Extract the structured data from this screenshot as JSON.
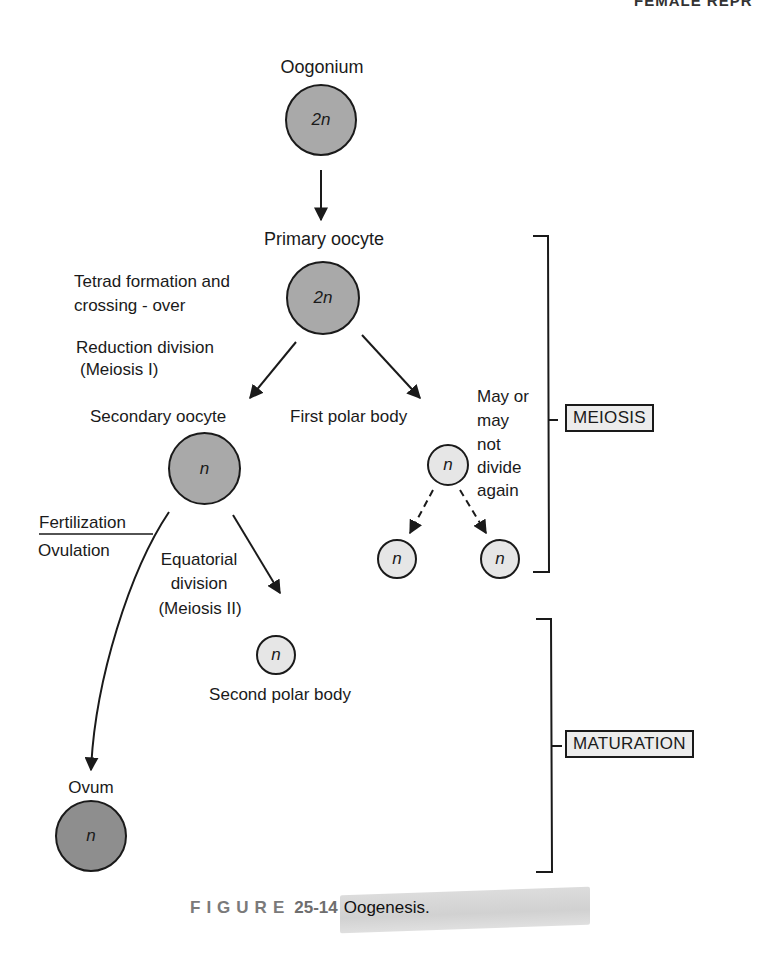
{
  "header": {
    "running_title": "FEMALE REPR"
  },
  "nodes": {
    "oogonium": {
      "label": "Oogonium",
      "ploidy": "2n"
    },
    "primary_oocyte": {
      "label": "Primary oocyte",
      "ploidy": "2n"
    },
    "secondary_oocyte": {
      "label": "Secondary oocyte",
      "ploidy": "n"
    },
    "first_polar_body": {
      "label": "First polar body",
      "ploidy": "n"
    },
    "first_polar_daughter_left": {
      "ploidy": "n"
    },
    "first_polar_daughter_right": {
      "ploidy": "n"
    },
    "second_polar_body": {
      "label": "Second polar body",
      "ploidy": "n"
    },
    "ovum": {
      "label": "Ovum",
      "ploidy": "n"
    }
  },
  "annotations": {
    "tetrad_line1": "Tetrad formation and",
    "tetrad_line2": "crossing - over",
    "reduction_line1": "Reduction division",
    "reduction_line2": "(Meiosis I)",
    "fertilization": "Fertilization",
    "ovulation": "Ovulation",
    "equatorial_line1": "Equatorial",
    "equatorial_line2": "division",
    "equatorial_line3": "(Meiosis II)",
    "may_line1": "May or",
    "may_line2": "may",
    "may_line3": "not",
    "may_line4": "divide",
    "may_line5": "again"
  },
  "phases": {
    "meiosis": "MEIOSIS",
    "maturation": "MATURATION"
  },
  "caption": {
    "word": "FIGURE",
    "number": "25-14",
    "title": "Oogenesis."
  },
  "colors": {
    "cell_2n": "#a9a9a9",
    "cell_polar": "#e6e6e6",
    "cell_ovum": "#8e8e8e",
    "stroke": "#1a1a1a"
  }
}
